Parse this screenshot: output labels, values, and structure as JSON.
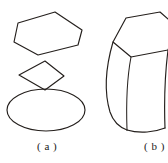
{
  "figure": {
    "panels": [
      {
        "id": "panel-a",
        "label": "( a )",
        "description": "exploded cross-section shapes",
        "shapes": [
          {
            "name": "hexagon",
            "type": "polygon",
            "points": "18,23 55,12 82,30 78,45 38,55 14,42"
          },
          {
            "name": "rhombus",
            "type": "polygon",
            "points": "45,61 64,76 45,90 19,75"
          },
          {
            "name": "ellipse",
            "type": "ellipse",
            "cx": 46,
            "cy": 110,
            "rx": 39,
            "ry": 21
          }
        ]
      },
      {
        "id": "panel-b",
        "label": "( b )",
        "description": "hyperboloid solid with hexagonal top face",
        "shapes": [
          {
            "name": "top-face-hexagon",
            "type": "path",
            "d": "M 113,42 L 126,18 L 160,12 L 176,26 L 168,50 L 131,57 Z"
          },
          {
            "name": "left-silhouette-curve",
            "type": "path",
            "d": "M 113,42 C 106,66 104,92 110,112 C 113,121 119,127 127,130"
          },
          {
            "name": "front-edge-curve",
            "type": "path",
            "d": "M 131,57 C 127,78 126,102 127,130"
          },
          {
            "name": "right-silhouette-curve",
            "type": "path",
            "d": "M 168,50 C 165,74 164,101 165,128"
          },
          {
            "name": "bottom-front-curve",
            "type": "path",
            "d": "M 127,130 C 140,134 155,132 165,128"
          }
        ]
      }
    ]
  },
  "colors": {
    "ink": "#241f1c",
    "background": "#ffffff"
  }
}
